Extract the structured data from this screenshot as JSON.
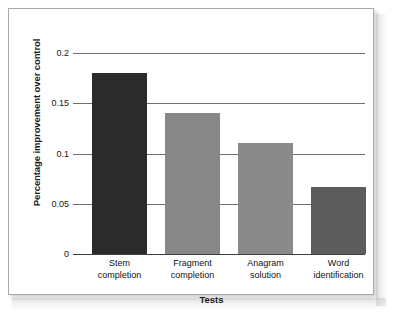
{
  "figure": {
    "frame_border_color": "#a9a9a9",
    "background_color": "#ffffff"
  },
  "chart_data": {
    "type": "bar",
    "title": "",
    "subtitle": "",
    "xlabel": "Tests",
    "ylabel": "Percentage improvement over control",
    "categories": [
      "Stem completion",
      "Fragment completion",
      "Anagram solution",
      "Word identification"
    ],
    "category_lines": [
      [
        "Stem",
        "completion"
      ],
      [
        "Fragment",
        "completion"
      ],
      [
        "Anagram",
        "solution"
      ],
      [
        "Word",
        "identification"
      ]
    ],
    "values": [
      0.18,
      0.14,
      0.11,
      0.067
    ],
    "bar_colors": [
      "#2b2b2b",
      "#878787",
      "#8a8a8a",
      "#5c5c5c"
    ],
    "ylim": [
      0,
      0.2
    ],
    "yticks": [
      0,
      0.05,
      0.1,
      0.15,
      0.2
    ],
    "ytick_labels": [
      "0",
      "0.05",
      "0.1",
      "0.15",
      "0.2"
    ],
    "xlim_categories": 4,
    "grid": "horizontal",
    "gridline_color": "#6f6f6f",
    "axis_color": "#3d3d3d",
    "legend": "none",
    "legend_position": "none",
    "annotations": []
  }
}
